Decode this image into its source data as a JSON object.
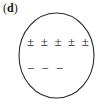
{
  "panel": {
    "label_open_paren": "(",
    "label_letter": "d",
    "label_close_paren": ")",
    "label_full": "(d)"
  },
  "diagram": {
    "shape": "circle",
    "outline_color": "#2b2b2b",
    "fill_color": "#ffffff",
    "symbol_color": "#1c1c1c",
    "positive_row": {
      "symbol": "±",
      "count": 5,
      "symbols": [
        "±",
        "±",
        "±",
        "±",
        "±"
      ]
    },
    "negative_row": {
      "symbol": "−",
      "count": 3,
      "symbols": [
        "−",
        "−",
        "−"
      ]
    }
  }
}
